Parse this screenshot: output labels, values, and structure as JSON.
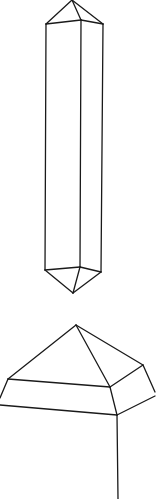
{
  "figure": {
    "stroke_color": "#1a1a1a",
    "background": "#ffffff",
    "crystals": [
      {
        "name": "doubly-terminated-crystal",
        "edges": [
          [
            [
              72,
              0
            ],
            [
              46,
              24
            ]
          ],
          [
            [
              72,
              0
            ],
            [
              81,
              20
            ]
          ],
          [
            [
              72,
              0
            ],
            [
              103,
              24
            ]
          ],
          [
            [
              46,
              24
            ],
            [
              81,
              20
            ]
          ],
          [
            [
              81,
              20
            ],
            [
              103,
              24
            ]
          ],
          [
            [
              46,
              24
            ],
            [
              45,
              270
            ]
          ],
          [
            [
              81,
              20
            ],
            [
              80,
              267
            ]
          ],
          [
            [
              103,
              24
            ],
            [
              101,
              272
            ]
          ],
          [
            [
              45,
              270
            ],
            [
              80,
              267
            ]
          ],
          [
            [
              80,
              267
            ],
            [
              101,
              272
            ]
          ],
          [
            [
              45,
              270
            ],
            [
              73,
              293
            ]
          ],
          [
            [
              80,
              267
            ],
            [
              73,
              293
            ]
          ],
          [
            [
              101,
              272
            ],
            [
              73,
              293
            ]
          ]
        ]
      },
      {
        "name": "single-terminated-crystal-cropped",
        "edges": [
          [
            [
              76,
              325
            ],
            [
              8,
              379
            ]
          ],
          [
            [
              76,
              325
            ],
            [
              110,
              387
            ]
          ],
          [
            [
              76,
              325
            ],
            [
              143,
              365
            ]
          ],
          [
            [
              8,
              379
            ],
            [
              110,
              387
            ]
          ],
          [
            [
              110,
              387
            ],
            [
              143,
              365
            ]
          ],
          [
            [
              8,
              379
            ],
            [
              0,
              398
            ]
          ],
          [
            [
              110,
              387
            ],
            [
              117,
              415
            ]
          ],
          [
            [
              143,
              365
            ],
            [
              155,
              392
            ]
          ],
          [
            [
              0,
              405
            ],
            [
              117,
              415
            ]
          ],
          [
            [
              117,
              415
            ],
            [
              155,
              396
            ]
          ],
          [
            [
              117,
              415
            ],
            [
              118,
              499
            ]
          ]
        ]
      }
    ]
  }
}
